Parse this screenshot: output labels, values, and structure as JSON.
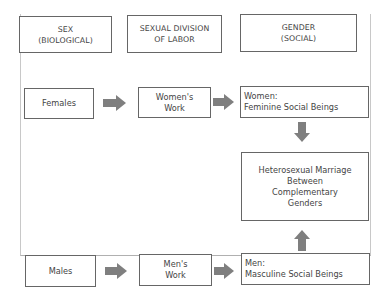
{
  "headers": {
    "sex": {
      "line1": "SEX",
      "line2": "(BIOLOGICAL)"
    },
    "division": {
      "line1": "SEXUAL DIVISION",
      "line2": "OF LABOR"
    },
    "gender": {
      "line1": "GENDER",
      "line2": "(SOCIAL)"
    }
  },
  "female_row": {
    "sex": "Females",
    "work": {
      "line1": "Women's",
      "line2": "Work"
    },
    "gender": {
      "line1": "Women:",
      "line2": "Feminine Social Beings"
    }
  },
  "male_row": {
    "sex": "Males",
    "work": {
      "line1": "Men's",
      "line2": "Work"
    },
    "gender": {
      "line1": "Men:",
      "line2": "Masculine Social Beings"
    }
  },
  "marriage": {
    "line1": "Heterosexual Marriage",
    "line2": "Between",
    "line3": "Complementary",
    "line4": "Genders"
  },
  "colors": {
    "arrow": "#7f7f7f",
    "border": "#666666"
  }
}
